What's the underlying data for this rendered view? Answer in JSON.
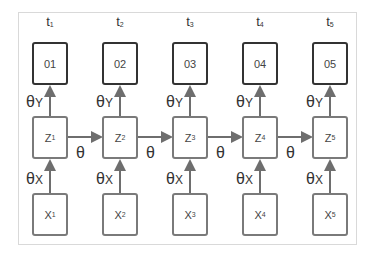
{
  "diagram": {
    "type": "recurrent-sequence-model",
    "timesteps": [
      {
        "label": "t",
        "index": "1",
        "output": "01",
        "hidden": "Z",
        "input": "X"
      },
      {
        "label": "t",
        "index": "2",
        "output": "02",
        "hidden": "Z",
        "input": "X"
      },
      {
        "label": "t",
        "index": "3",
        "output": "03",
        "hidden": "Z",
        "input": "X"
      },
      {
        "label": "t",
        "index": "4",
        "output": "04",
        "hidden": "Z",
        "input": "X"
      },
      {
        "label": "t",
        "index": "5",
        "output": "05",
        "hidden": "Z",
        "input": "X"
      }
    ],
    "params": {
      "theta": "θ",
      "output_suffix": "Y",
      "input_suffix": "X"
    },
    "edges": {
      "input_to_hidden_label": "θX",
      "hidden_to_output_label": "θY",
      "hidden_to_hidden_label": "θ"
    },
    "colors": {
      "output_border": "#333333",
      "node_border": "#7a7a7a",
      "arrow": "#6e6e6e",
      "frame": "#d9d9d9"
    }
  }
}
